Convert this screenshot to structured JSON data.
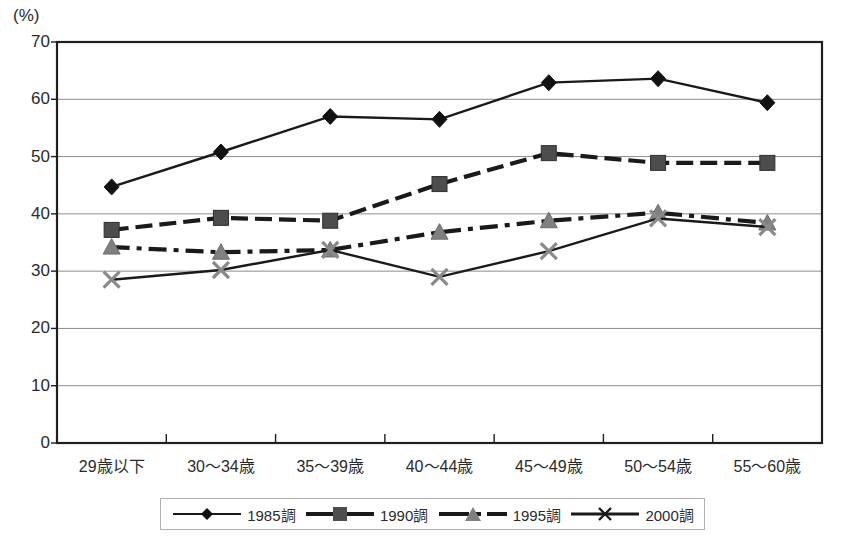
{
  "chart_data": {
    "type": "line",
    "title": "",
    "subtitle": "",
    "xlabel": "",
    "ylabel": "(%)",
    "unit_label": "(%)",
    "categories": [
      "29歳以下",
      "30〜34歳",
      "35〜39歳",
      "40〜44歳",
      "45〜49歳",
      "50〜54歳",
      "55〜60歳"
    ],
    "yticks": [
      0,
      10,
      20,
      30,
      40,
      50,
      60,
      70
    ],
    "ylim": [
      0,
      70
    ],
    "grid": true,
    "legend_position": "bottom",
    "series": [
      {
        "name": "1985調",
        "marker": "diamond",
        "line_style": "solid",
        "color": "#1a1a1a",
        "marker_color": "#111111",
        "values": [
          44.7,
          50.8,
          57.0,
          56.5,
          62.9,
          63.6,
          59.4
        ]
      },
      {
        "name": "1990調",
        "marker": "square",
        "line_style": "dashed",
        "color": "#1a1a1a",
        "marker_color": "#4d4d4d",
        "values": [
          37.2,
          39.3,
          38.8,
          45.2,
          50.6,
          48.9,
          48.9
        ]
      },
      {
        "name": "1995調",
        "marker": "triangle",
        "line_style": "dashdot",
        "color": "#1a1a1a",
        "marker_color": "#808080",
        "values": [
          34.2,
          33.3,
          33.7,
          36.8,
          38.8,
          40.2,
          38.4
        ]
      },
      {
        "name": "2000調",
        "marker": "cross",
        "line_style": "solid",
        "color": "#1a1a1a",
        "marker_color": "#8a8a8a",
        "values": [
          28.5,
          30.2,
          33.7,
          29.0,
          33.5,
          39.2,
          37.7
        ]
      }
    ]
  },
  "legend": {
    "items": [
      {
        "label": "1985調"
      },
      {
        "label": "1990調"
      },
      {
        "label": "1995調"
      },
      {
        "label": "2000調"
      }
    ]
  }
}
